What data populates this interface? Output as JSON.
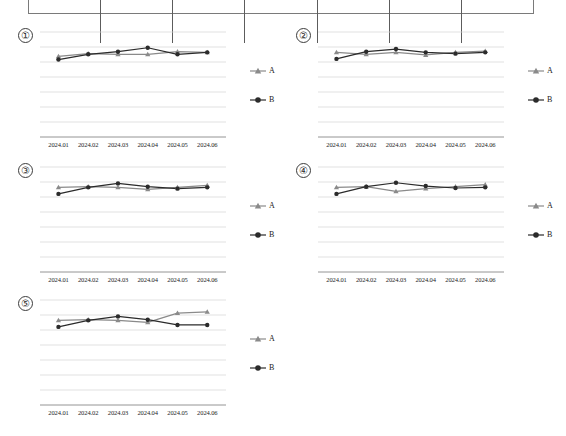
{
  "table_fragment": {
    "columns": 7,
    "visible": true,
    "border_color": "#7a7a7a"
  },
  "series_colors": {
    "A": "#8a8a8a",
    "B": "#2b2b2b",
    "gridline": "#d4d4d4",
    "axis": "#9a9a9a"
  },
  "legend": {
    "a_label": "A",
    "b_label": "B",
    "a_marker": "triangle-marker-icon",
    "b_marker": "circle-marker-icon"
  },
  "panels": [
    {
      "number": "①"
    },
    {
      "number": "②"
    },
    {
      "number": "③"
    },
    {
      "number": "④"
    },
    {
      "number": "⑤"
    }
  ],
  "chart_data": [
    {
      "type": "line",
      "title": "①",
      "xlabel": "",
      "ylabel": "",
      "grid": true,
      "legend_position": "right",
      "categories": [
        "2024.01",
        "2024.02",
        "2024.03",
        "2024.04",
        "2024.05",
        "2024.06"
      ],
      "ylim": [
        0,
        8
      ],
      "series": [
        {
          "name": "A",
          "marker": "triangle",
          "color": "#8a8a8a",
          "values": [
            6.15,
            6.35,
            6.3,
            6.3,
            6.5,
            6.45
          ]
        },
        {
          "name": "B",
          "marker": "circle",
          "color": "#2b2b2b",
          "values": [
            5.9,
            6.3,
            6.5,
            6.8,
            6.3,
            6.45
          ]
        }
      ]
    },
    {
      "type": "line",
      "title": "②",
      "xlabel": "",
      "ylabel": "",
      "grid": true,
      "legend_position": "right",
      "categories": [
        "2024.01",
        "2024.02",
        "2024.03",
        "2024.04",
        "2024.05",
        "2024.06"
      ],
      "ylim": [
        0,
        8
      ],
      "series": [
        {
          "name": "A",
          "marker": "triangle",
          "color": "#8a8a8a",
          "values": [
            6.45,
            6.3,
            6.45,
            6.25,
            6.45,
            6.55
          ]
        },
        {
          "name": "B",
          "marker": "circle",
          "color": "#2b2b2b",
          "values": [
            5.95,
            6.5,
            6.7,
            6.45,
            6.35,
            6.45
          ]
        }
      ]
    },
    {
      "type": "line",
      "title": "③",
      "xlabel": "",
      "ylabel": "",
      "grid": true,
      "legend_position": "right",
      "categories": [
        "2024.01",
        "2024.02",
        "2024.03",
        "2024.04",
        "2024.05",
        "2024.06"
      ],
      "ylim": [
        0,
        8
      ],
      "series": [
        {
          "name": "A",
          "marker": "triangle",
          "color": "#8a8a8a",
          "values": [
            6.45,
            6.5,
            6.45,
            6.3,
            6.45,
            6.6
          ]
        },
        {
          "name": "B",
          "marker": "circle",
          "color": "#2b2b2b",
          "values": [
            5.95,
            6.45,
            6.75,
            6.5,
            6.35,
            6.45
          ]
        }
      ]
    },
    {
      "type": "line",
      "title": "④",
      "xlabel": "",
      "ylabel": "",
      "grid": true,
      "legend_position": "right",
      "categories": [
        "2024.01",
        "2024.02",
        "2024.03",
        "2024.04",
        "2024.05",
        "2024.06"
      ],
      "ylim": [
        0,
        8
      ],
      "series": [
        {
          "name": "A",
          "marker": "triangle",
          "color": "#8a8a8a",
          "values": [
            6.45,
            6.5,
            6.15,
            6.35,
            6.5,
            6.65
          ]
        },
        {
          "name": "B",
          "marker": "circle",
          "color": "#2b2b2b",
          "values": [
            5.95,
            6.5,
            6.8,
            6.55,
            6.4,
            6.45
          ]
        }
      ]
    },
    {
      "type": "line",
      "title": "⑤",
      "xlabel": "",
      "ylabel": "",
      "grid": true,
      "legend_position": "right",
      "categories": [
        "2024.01",
        "2024.02",
        "2024.03",
        "2024.04",
        "2024.05",
        "2024.06"
      ],
      "ylim": [
        0,
        8
      ],
      "series": [
        {
          "name": "A",
          "marker": "triangle",
          "color": "#8a8a8a",
          "values": [
            6.45,
            6.5,
            6.45,
            6.3,
            7.0,
            7.1
          ]
        },
        {
          "name": "B",
          "marker": "circle",
          "color": "#2b2b2b",
          "values": [
            5.95,
            6.45,
            6.75,
            6.5,
            6.1,
            6.1
          ]
        }
      ]
    }
  ]
}
